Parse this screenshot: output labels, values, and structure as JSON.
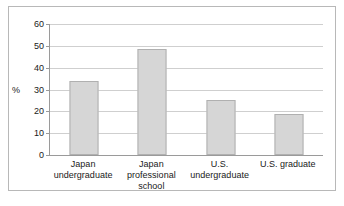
{
  "chart_data": {
    "type": "bar",
    "title": "",
    "xlabel": "",
    "ylabel": "%",
    "ylim": [
      0,
      60
    ],
    "ytick_step": 10,
    "yticks": [
      "0",
      "10",
      "20",
      "30",
      "40",
      "50",
      "60"
    ],
    "grid": true,
    "legend": "none",
    "categories": [
      "Japan undergraduate",
      "Japan professional school",
      "U.S. undergraduate",
      "U.S. graduate"
    ],
    "category_lines": [
      [
        "Japan",
        "undergraduate"
      ],
      [
        "Japan professional",
        "school"
      ],
      [
        "U.S.",
        "undergraduate"
      ],
      [
        "U.S. graduate",
        ""
      ]
    ],
    "values": [
      34,
      48.5,
      25,
      19
    ],
    "colors": {
      "bar_fill": "#d6d6d6",
      "bar_stroke": "#b0b0b0",
      "gridline": "#cfcfcf",
      "axis": "#9a9a9a",
      "frame": "#b8b8b8",
      "text": "#1a1a1a"
    }
  }
}
